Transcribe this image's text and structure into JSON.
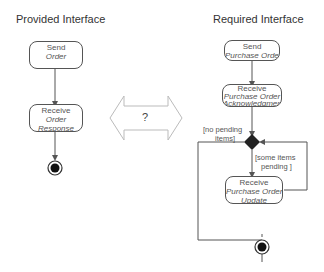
{
  "titles": {
    "provided": "Provided Interface",
    "required": "Required Interface"
  },
  "provided": {
    "nodes": [
      {
        "line1": "Send",
        "line2": "Order"
      },
      {
        "line1": "Receive",
        "line2": "Order",
        "line3": "Response"
      }
    ]
  },
  "required": {
    "nodes": [
      {
        "line1": "Send",
        "line2": "Purchase Order"
      },
      {
        "line1": "Receive",
        "line2": "Purchase Order",
        "line3": "Acknowledgment"
      },
      {
        "line1": "Receive",
        "line2": "Purchase Order",
        "line3": "Update"
      }
    ],
    "guards": {
      "no_pending": "[no pending",
      "no_pending_2": "items]",
      "some_pending": "[some items",
      "some_pending_2": "pending ]"
    }
  },
  "mapping_arrow": {
    "label": "?"
  },
  "colors": {
    "line": "#555555",
    "arrow_outline": "#aaaaaa",
    "diamond": "#222222"
  }
}
